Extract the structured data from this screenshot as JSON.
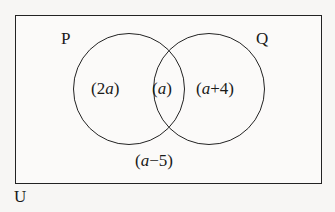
{
  "diagram": {
    "type": "venn-two-set",
    "universe_label": "U",
    "sets": [
      {
        "id": "P",
        "label": "P"
      },
      {
        "id": "Q",
        "label": "Q"
      }
    ],
    "regions": [
      {
        "id": "p-only",
        "label": "(2a)",
        "expression": "2a"
      },
      {
        "id": "intersection",
        "label": "(a)",
        "expression": "a"
      },
      {
        "id": "q-only",
        "label": "(a+4)",
        "expression": "a+4"
      },
      {
        "id": "outside",
        "label": "(a−5)",
        "expression": "a-5"
      }
    ],
    "colors": {
      "stroke": "#232323",
      "text": "#1a1a1a",
      "background": "#f7f6f4",
      "rect_fill": "#fbfaf9"
    }
  }
}
